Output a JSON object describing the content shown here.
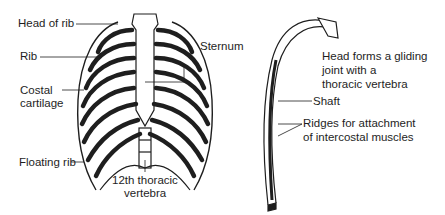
{
  "figure": {
    "left_panel": {
      "title": "Rib cage (anterior view)",
      "labels": {
        "head_of_rib": "Head of rib",
        "rib": "Rib",
        "costal_cartilage_1": "Costal",
        "costal_cartilage_2": "cartilage",
        "floating_rib": "Floating rib",
        "sternum": "Sternum",
        "vertebra_1": "12th thoracic",
        "vertebra_2": "vertebra"
      }
    },
    "right_panel": {
      "title": "Single rib",
      "labels": {
        "head_1": "Head forms a gliding",
        "head_2": "joint with a",
        "head_3": "thoracic vertebra",
        "shaft": "Shaft",
        "ridges_1": "Ridges for attachment",
        "ridges_2": "of intercostal muscles"
      }
    },
    "colors": {
      "ink": "#1e1e1e",
      "fill": "#ffffff"
    }
  }
}
